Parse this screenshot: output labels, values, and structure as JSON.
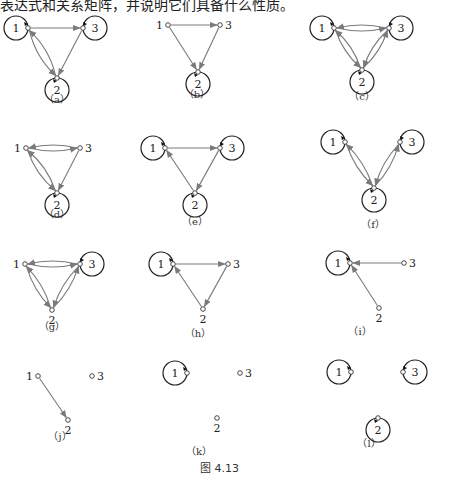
{
  "header_text": "表达式和关系矩阵，并说明它们具备什么性质。",
  "figure_caption": "图 4.13",
  "colors": {
    "edge": "#7a7a7a",
    "loop": "#222222",
    "node_stroke": "#333333",
    "text": "#222222"
  },
  "graphs": [
    {
      "id": "a",
      "caption": "（a）",
      "cap": [
        57,
        103
      ],
      "nodes": {
        "1": [
          28,
          28
        ],
        "2": [
          57,
          78
        ],
        "3": [
          83,
          28
        ]
      },
      "loops": [
        "1",
        "2",
        "3"
      ],
      "edges": [
        [
          "1",
          "3",
          0
        ],
        [
          "3",
          "2",
          0
        ],
        [
          "1",
          "2",
          8
        ],
        [
          "2",
          "1",
          8
        ]
      ]
    },
    {
      "id": "b",
      "caption": "（b）",
      "cap": [
        197,
        98
      ],
      "nodes": {
        "1": [
          168,
          25
        ],
        "2": [
          198,
          72
        ],
        "3": [
          220,
          25
        ]
      },
      "loops": [
        "2"
      ],
      "edges": [
        [
          "1",
          "3",
          0
        ],
        [
          "1",
          "2",
          0
        ],
        [
          "3",
          "2",
          0
        ]
      ]
    },
    {
      "id": "c",
      "caption": "（c）",
      "cap": [
        362,
        100
      ],
      "nodes": {
        "1": [
          334,
          28
        ],
        "2": [
          362,
          70
        ],
        "3": [
          389,
          28
        ]
      },
      "loops": [
        "1",
        "2",
        "3"
      ],
      "edges": [
        [
          "1",
          "3",
          6
        ],
        [
          "3",
          "1",
          6
        ],
        [
          "1",
          "2",
          6
        ],
        [
          "2",
          "1",
          6
        ],
        [
          "3",
          "2",
          6
        ],
        [
          "2",
          "3",
          6
        ]
      ]
    },
    {
      "id": "d",
      "caption": "（d）",
      "cap": [
        57,
        218
      ],
      "nodes": {
        "1": [
          26,
          148
        ],
        "2": [
          57,
          193
        ],
        "3": [
          80,
          148
        ]
      },
      "loops": [
        "2"
      ],
      "edges": [
        [
          "1",
          "3",
          6
        ],
        [
          "3",
          "1",
          6
        ],
        [
          "1",
          "2",
          7
        ],
        [
          "2",
          "1",
          7
        ],
        [
          "3",
          "2",
          0
        ]
      ]
    },
    {
      "id": "e",
      "caption": "（e）",
      "cap": [
        195,
        225
      ],
      "nodes": {
        "1": [
          165,
          148
        ],
        "2": [
          195,
          193
        ],
        "3": [
          220,
          148
        ]
      },
      "loops": [
        "1",
        "2",
        "3"
      ],
      "edges": [
        [
          "1",
          "3",
          0
        ],
        [
          "3",
          "2",
          0
        ],
        [
          "2",
          "1",
          0
        ]
      ]
    },
    {
      "id": "f",
      "caption": "（f）",
      "cap": [
        373,
        228
      ],
      "nodes": {
        "1": [
          345,
          142
        ],
        "2": [
          374,
          188
        ],
        "3": [
          400,
          142
        ]
      },
      "loops": [
        "1",
        "2",
        "3"
      ],
      "edges": [
        [
          "1",
          "2",
          6
        ],
        [
          "2",
          "1",
          6
        ],
        [
          "3",
          "2",
          6
        ],
        [
          "2",
          "3",
          6
        ]
      ]
    },
    {
      "id": "g",
      "caption": "（g）",
      "cap": [
        52,
        330
      ],
      "nodes": {
        "1": [
          25,
          264
        ],
        "2": [
          52,
          310
        ],
        "3": [
          80,
          264
        ]
      },
      "loops": [
        "3"
      ],
      "edges": [
        [
          "1",
          "3",
          6
        ],
        [
          "3",
          "1",
          6
        ],
        [
          "1",
          "2",
          6
        ],
        [
          "2",
          "1",
          6
        ],
        [
          "3",
          "2",
          6
        ],
        [
          "2",
          "3",
          6
        ]
      ]
    },
    {
      "id": "h",
      "caption": "（h）",
      "cap": [
        198,
        337
      ],
      "nodes": {
        "1": [
          173,
          264
        ],
        "2": [
          203,
          309
        ],
        "3": [
          228,
          264
        ]
      },
      "loops": [
        "1"
      ],
      "edges": [
        [
          "1",
          "3",
          0
        ],
        [
          "3",
          "2",
          0
        ],
        [
          "2",
          "1",
          0
        ]
      ]
    },
    {
      "id": "i",
      "caption": "（i）",
      "cap": [
        360,
        335
      ],
      "nodes": {
        "1": [
          350,
          263
        ],
        "2": [
          379,
          308
        ],
        "3": [
          404,
          263
        ]
      },
      "loops": [
        "1"
      ],
      "edges": [
        [
          "3",
          "1",
          0
        ],
        [
          "2",
          "1",
          0
        ]
      ]
    },
    {
      "id": "j",
      "caption": "（j）",
      "cap": [
        60,
        440
      ],
      "nodes": {
        "1": [
          38,
          376
        ],
        "2": [
          68,
          420
        ],
        "3": [
          92,
          376
        ]
      },
      "loops": [],
      "edges": [
        [
          "1",
          "2",
          0
        ]
      ]
    },
    {
      "id": "k",
      "caption": "（k）",
      "cap": [
        199,
        455
      ],
      "nodes": {
        "1": [
          187,
          373
        ],
        "2": [
          217,
          418
        ],
        "3": [
          240,
          373
        ]
      },
      "loops": [
        "1"
      ],
      "edges": []
    },
    {
      "id": "l",
      "caption": "（l）",
      "cap": [
        369,
        447
      ],
      "nodes": {
        "1": [
          351,
          372
        ],
        "2": [
          378,
          418
        ],
        "3": [
          403,
          372
        ]
      },
      "loops": [
        "1",
        "2",
        "3"
      ],
      "edges": []
    }
  ]
}
